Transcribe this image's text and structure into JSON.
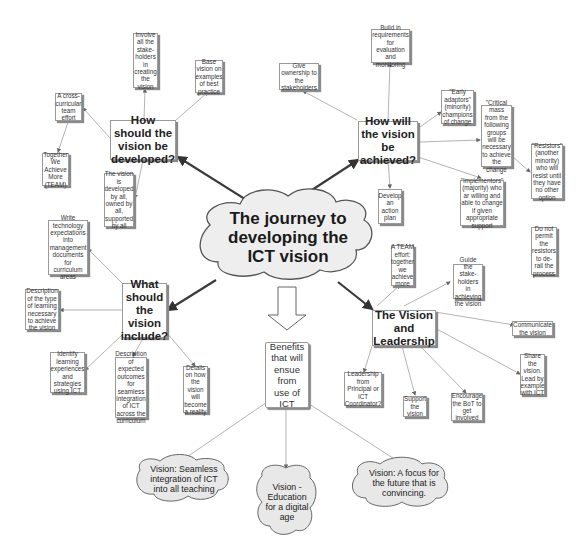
{
  "diagram": {
    "type": "mind-map",
    "center": {
      "label": "The journey to developing the ICT vision"
    },
    "hubs": {
      "developed": {
        "label": "How should the vision be developed?",
        "children": [
          "Involve all the stake-holders in creating the vision",
          "Base vision on examples of best practice",
          "A cross-curricular team effort",
          "Together We Achieve More (TEAM)",
          "The vision is developed by all, owned by all, supported by all"
        ]
      },
      "achieved": {
        "label": "How will the vision be achieved?",
        "children": [
          "Build in requirements for evaluation and monitoring",
          "Give ownership to the stakeholders",
          "\"Early adaptors\" (minority) champions of change",
          "\"Critical mass from the following groups will be necessary to achieve the change",
          "\"Resistors\" (another minority) who will resist until they have no other option",
          "\"Implementors\" (majority) who ar willing and able to change if given appropriate support",
          "Develop an action plan",
          "Do not permit the resistors to de-rail the process"
        ]
      },
      "include": {
        "label": "What should the vision include?",
        "children": [
          "Write technology expectations into management documents for curriculum areas",
          "Description of the type of learning necessary to achieve the vision",
          "Identify learning experiences and strategies using ICT",
          "Description of expected outcomes for seamless integration of ICT across the curriculum",
          "Details on how the vision will become a reality"
        ]
      },
      "leadership": {
        "label": "The Vision and Leadership",
        "children": [
          "A TEAM effort: together we achieve more",
          "Guide the stake-holders in achieving the vision",
          "Communicate the vision",
          "Share the vision. Lead by example with ICT",
          "Leadership from Principal or ICT Coordinator?",
          "Support the vision",
          "Encourage the BoT to get involved"
        ]
      }
    },
    "benefits": {
      "label": "Benefits that will ensue from use of ICT",
      "visions": [
        "Vision: Seamless integration of ICT into all teaching",
        "Vision - Education for a digital age",
        "Vision: A focus for the future that is convincing."
      ]
    }
  }
}
